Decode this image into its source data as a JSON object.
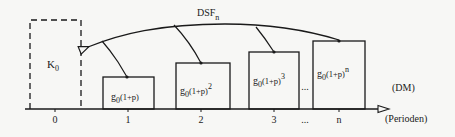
{
  "diagram": {
    "curve_label": {
      "main": "DSF",
      "sub": "n"
    },
    "initial_box": {
      "main": "K",
      "sub": "0"
    },
    "boxes": [
      {
        "base": "g",
        "sub": "0",
        "expr": "(1+p)",
        "exp": ""
      },
      {
        "base": "g",
        "sub": "0",
        "expr": "(1+p)",
        "exp": "2"
      },
      {
        "base": "g",
        "sub": "0",
        "expr": "(1+p)",
        "exp": "3"
      },
      {
        "base": "g",
        "sub": "0",
        "expr": "(1+p)",
        "exp": "n"
      }
    ],
    "between_boxes_ellipsis": "...",
    "unit_label": "(DM)",
    "axis_label": "(Perioden)",
    "ticks": [
      "0",
      "1",
      "2",
      "3",
      "...",
      "n"
    ],
    "colors": {
      "line": "#1a1a1a",
      "background": "#f7f7f5"
    }
  }
}
